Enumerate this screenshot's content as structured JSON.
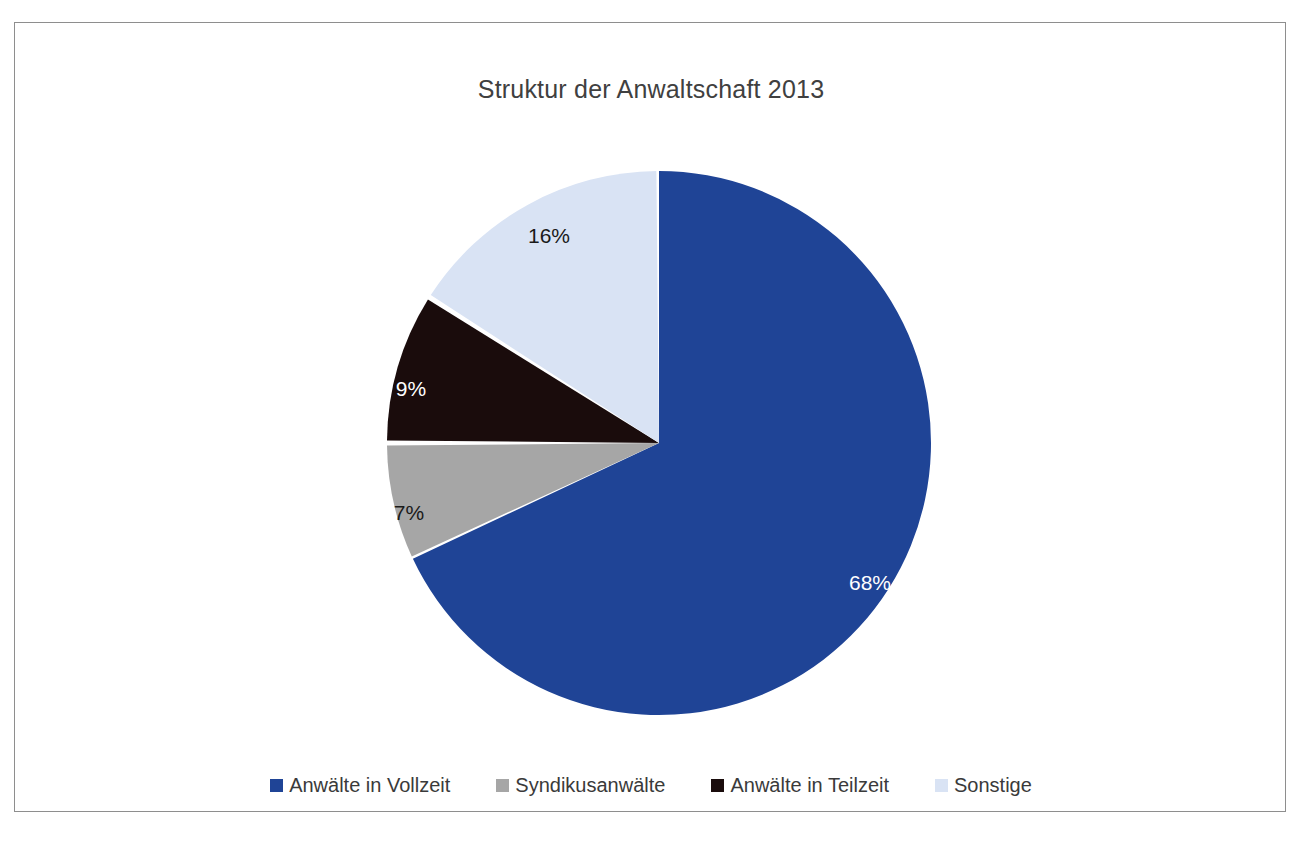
{
  "chart_data": {
    "type": "pie",
    "title": "Struktur der Anwaltschaft 2013",
    "xlabel": "",
    "ylabel": "",
    "legend_position": "bottom",
    "grid": false,
    "categories": [
      "Anwälte in Vollzeit",
      "Syndikusanwälte",
      "Anwälte in Teilzeit",
      "Sonstige"
    ],
    "values": [
      68,
      7,
      9,
      16
    ],
    "value_labels": [
      "68%",
      "7%",
      "9%",
      "16%"
    ],
    "colors": [
      "#1F4496",
      "#A6A6A6",
      "#1A0C0C",
      "#D9E3F4"
    ],
    "label_text_colors": [
      "#FFFFFF",
      "#1A1A1A",
      "#FFFFFF",
      "#1A1A1A"
    ],
    "slices": [
      {
        "name": "Anwälte in Vollzeit",
        "value": 68,
        "label": "68%",
        "color": "#1F4496",
        "label_color": "#FFFFFF",
        "label_x": 855,
        "label_y": 560
      },
      {
        "name": "Syndikusanwälte",
        "value": 7,
        "label": "7%",
        "color": "#A6A6A6",
        "label_color": "#1A1A1A",
        "label_x": 394,
        "label_y": 490
      },
      {
        "name": "Anwälte in Teilzeit",
        "value": 9,
        "label": "9%",
        "color": "#1A0C0C",
        "label_color": "#FFFFFF",
        "label_x": 396,
        "label_y": 366
      },
      {
        "name": "Sonstige",
        "value": 16,
        "label": "16%",
        "color": "#D9E3F4",
        "label_color": "#1A1A1A",
        "label_x": 534,
        "label_y": 213
      }
    ]
  },
  "legend": {
    "items": [
      {
        "label": "Anwälte in Vollzeit",
        "color": "#1F4496"
      },
      {
        "label": "Syndikusanwälte",
        "color": "#A6A6A6"
      },
      {
        "label": "Anwälte in Teilzeit",
        "color": "#1A0C0C"
      },
      {
        "label": "Sonstige",
        "color": "#D9E3F4"
      }
    ]
  },
  "style": {
    "background": "#FFFFFF",
    "frame_border": "#8E8E8E",
    "title_color": "#404040"
  }
}
